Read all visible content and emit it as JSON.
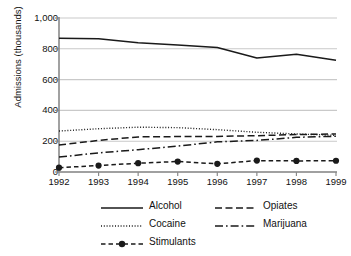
{
  "chart_data": {
    "type": "line",
    "title": "",
    "xlabel": "",
    "ylabel": "Admissions (thousands)",
    "x": [
      1992,
      1993,
      1994,
      1995,
      1996,
      1997,
      1998,
      1999
    ],
    "categories": [
      "1992",
      "1993",
      "1994",
      "1995",
      "1996",
      "1997",
      "1998",
      "1999"
    ],
    "ylim": [
      0,
      1000
    ],
    "yticks": [
      0,
      200,
      400,
      600,
      800,
      1000
    ],
    "ytick_labels": [
      "0",
      "200",
      "400",
      "600",
      "800",
      "1,000"
    ],
    "grid": "horizontal",
    "legend_position": "bottom",
    "series": [
      {
        "name": "Alcohol",
        "style": "solid",
        "marker": "none",
        "color": "#1a1a1a",
        "values": [
          868,
          866,
          840,
          825,
          808,
          740,
          765,
          725
        ]
      },
      {
        "name": "Cocaine",
        "style": "dotted",
        "marker": "none",
        "color": "#1a1a1a",
        "values": [
          266,
          281,
          291,
          288,
          275,
          258,
          247,
          238
        ]
      },
      {
        "name": "Opiates",
        "style": "dashed",
        "marker": "none",
        "color": "#1a1a1a",
        "values": [
          175,
          205,
          228,
          230,
          231,
          236,
          243,
          247
        ]
      },
      {
        "name": "Marijuana",
        "style": "dashdot",
        "marker": "none",
        "color": "#1a1a1a",
        "values": [
          97,
          124,
          145,
          168,
          196,
          205,
          225,
          232
        ]
      },
      {
        "name": "Stimulants",
        "style": "dashed-marker",
        "marker": "circle",
        "color": "#1a1a1a",
        "values": [
          28,
          42,
          57,
          68,
          53,
          74,
          72,
          73
        ]
      }
    ]
  },
  "legend": {
    "items": [
      {
        "label": "Alcohol",
        "style": "solid"
      },
      {
        "label": "Opiates",
        "style": "dashed"
      },
      {
        "label": "Cocaine",
        "style": "dotted"
      },
      {
        "label": "Marijuana",
        "style": "dashdot"
      },
      {
        "label": "Stimulants",
        "style": "dashed-marker"
      }
    ]
  },
  "colors": {
    "ink": "#1a1a1a",
    "grid": "#c9c9c9",
    "axis": "#8a8a8a",
    "background": "#ffffff"
  }
}
